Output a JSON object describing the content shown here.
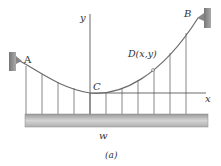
{
  "diagram": {
    "caption": "(a)",
    "labels": {
      "support_left": "A",
      "support_right": "B",
      "lowest_point": "C",
      "point_on_cable": "D(x,y)",
      "x_axis": "x",
      "y_axis": "y",
      "load": "w"
    },
    "hangers_count": 11,
    "colors": {
      "cable": "#6b6b6b",
      "hangers": "#555555",
      "axes": "#444444",
      "deck_fill": "#c8c8c8",
      "support_fill": "#8a8a8a"
    }
  }
}
